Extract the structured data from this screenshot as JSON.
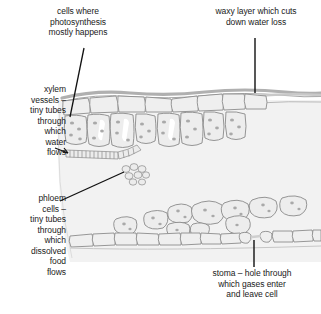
{
  "diagram": {
    "background_color": "#ffffff",
    "leaf_tint_color": "#f2f2f2",
    "cell_fill_color": "#eeeeee",
    "cell_stroke_color": "#8c8c8c",
    "cuticle_color": "#b3b3b3",
    "chloroplast_color": "#a9a9a9",
    "leader_line_color": "#111111",
    "text_color": "#1a1a1a"
  },
  "labels": {
    "photosynthesis": {
      "text": "cells where\nphotosynthesis\nmostly happens",
      "points_to": "palisade-mesophyll-cells"
    },
    "waxy_layer": {
      "text": "waxy layer which cuts\ndown water loss",
      "points_to": "waxy-cuticle-layer"
    },
    "xylem": {
      "text": "xylem\nvessels –\ntiny tubes\nthrough\nwhich\nwater\nflows",
      "points_to": "xylem-vessel"
    },
    "phloem": {
      "text": "phloem\ncells –\ntiny tubes\nthrough\nwhich\ndissolved\nfood\nflows",
      "points_to": "phloem-cells"
    },
    "stoma": {
      "text": "stoma – hole through\nwhich gases enter\nand leave cell",
      "points_to": "stoma-pore"
    }
  },
  "structures": [
    {
      "name": "waxy-cuticle-layer",
      "description": "wavy grey band across the top of the leaf"
    },
    {
      "name": "upper-epidermis",
      "description": "single row of flat rectangular cells below the cuticle"
    },
    {
      "name": "palisade-mesophyll-cells",
      "description": "tall column-shaped cells packed with chloroplasts"
    },
    {
      "name": "xylem-vessel",
      "description": "horizontal chain of narrow segmented tube cells"
    },
    {
      "name": "phloem-cells",
      "description": "small cluster of rounded sieve cells"
    },
    {
      "name": "spongy-mesophyll",
      "description": "loosely packed rounded cells with air spaces"
    },
    {
      "name": "lower-epidermis",
      "description": "row of flat cells along the underside of the leaf"
    },
    {
      "name": "stoma-pore",
      "description": "gap in the lower epidermis between two guard cells"
    }
  ]
}
